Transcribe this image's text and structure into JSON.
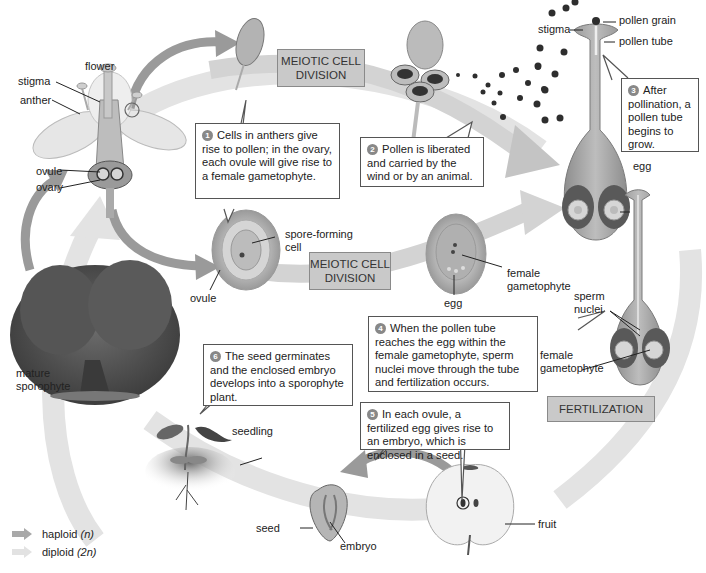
{
  "diagram": {
    "type": "life-cycle",
    "colors": {
      "haploid_arrow": "#a9a9a9",
      "diploid_arrow": "#e2e2e2",
      "stage_box_fill": "#c9c9c9",
      "callout_border": "#555555",
      "step_number_fill": "#888888"
    }
  },
  "labels": {
    "flower": "flower",
    "stigma_flower": "stigma",
    "anther": "anther",
    "ovule_flower": "ovule",
    "ovary": "ovary",
    "spore_forming_cell": "spore-forming\ncell",
    "ovule_meiosis": "ovule",
    "female_gametophyte_1": "female\ngametophyte",
    "egg_1": "egg",
    "stigma_pistil": "stigma",
    "pollen_grain": "pollen grain",
    "pollen_tube": "pollen tube",
    "egg_2": "egg",
    "sperm_nuclei": "sperm\nnuclei",
    "female_gametophyte_2": "female\ngametophyte",
    "mature_sporophyte": "mature\nsporophyte",
    "seedling": "seedling",
    "fruit": "fruit",
    "seed": "seed",
    "embryo": "embryo"
  },
  "stages": {
    "meiosis_top": "MEIOTIC CELL DIVISION",
    "meiosis_middle": "MEIOTIC CELL DIVISION",
    "fertilization": "FERTILIZATION"
  },
  "steps": [
    {
      "num": "1",
      "text": "Cells in anthers give rise to pollen; in the ovary, each ovule will give rise to a female gametophyte."
    },
    {
      "num": "2",
      "text": "Pollen is liberated and carried by the wind or by an animal."
    },
    {
      "num": "3",
      "text": "After pollination, a pollen tube begins to grow."
    },
    {
      "num": "4",
      "text": "When the pollen tube reaches the egg within the female gametophyte, sperm nuclei move through the tube and fertilization occurs."
    },
    {
      "num": "5",
      "text": "In each ovule, a fertilized egg gives rise to an embryo, which is enclosed in a seed."
    },
    {
      "num": "6",
      "text": "The seed germinates and the enclosed embryo develops into a sporophyte plant."
    }
  ],
  "legend": {
    "haploid_label": "haploid",
    "haploid_symbol": "(n)",
    "diploid_label": "diploid",
    "diploid_symbol": "(2n)"
  }
}
